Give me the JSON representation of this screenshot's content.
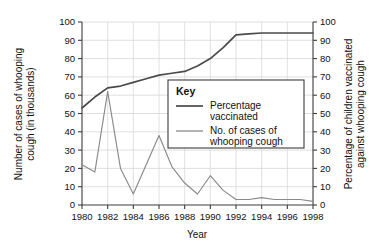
{
  "chart_data": {
    "type": "line",
    "title": "",
    "xlabel": "Year",
    "y_left_label": "Number of cases of whooping cough (in thousands)",
    "y_right_label": "Percentage of children vaccinated against whooping cough",
    "xlim": [
      1980,
      1998
    ],
    "ylim": [
      0,
      100
    ],
    "y_right_lim": [
      0,
      100
    ],
    "grid": true,
    "legend_position": "inside-upper-center",
    "legend_title": "Key",
    "x_tick_labels": [
      "1980",
      "1982",
      "1984",
      "1986",
      "1988",
      "1990",
      "1992",
      "1994",
      "1996",
      "1998"
    ],
    "x_ticks": [
      1980,
      1982,
      1984,
      1986,
      1988,
      1990,
      1992,
      1994,
      1996,
      1998
    ],
    "y_tick_labels": [
      "0",
      "10",
      "20",
      "30",
      "40",
      "50",
      "60",
      "70",
      "80",
      "90",
      "100"
    ],
    "y_ticks": [
      0,
      10,
      20,
      30,
      40,
      50,
      60,
      70,
      80,
      90,
      100
    ],
    "y_right_tick_labels": [
      "0",
      "10",
      "20",
      "30",
      "40",
      "50",
      "60",
      "70",
      "80",
      "90",
      "100"
    ],
    "y_right_ticks": [
      0,
      10,
      20,
      30,
      40,
      50,
      60,
      70,
      80,
      90,
      100
    ],
    "x": [
      1980,
      1981,
      1982,
      1983,
      1984,
      1985,
      1986,
      1987,
      1988,
      1989,
      1990,
      1991,
      1992,
      1993,
      1994,
      1995,
      1996,
      1997,
      1998
    ],
    "series": [
      {
        "name": "Percentage vaccinated",
        "axis": "right",
        "color": "#4a4a4a",
        "values": [
          53,
          59,
          64,
          65,
          67,
          69,
          71,
          72,
          73,
          76,
          80,
          86,
          93,
          93.5,
          94,
          94,
          94,
          94,
          94
        ]
      },
      {
        "name": "No. of cases of whooping cough",
        "axis": "left",
        "color": "#8a8a8a",
        "values": [
          22,
          18,
          62,
          20,
          6,
          22,
          38,
          21,
          12,
          6,
          16,
          8,
          3,
          3,
          4,
          3,
          3,
          3,
          2
        ]
      }
    ]
  },
  "legend": {
    "title": "Key",
    "entries": [
      {
        "label_line1": "Percentage",
        "label_line2": "vaccinated"
      },
      {
        "label_line1": "No. of cases of",
        "label_line2": "whooping cough"
      }
    ]
  }
}
